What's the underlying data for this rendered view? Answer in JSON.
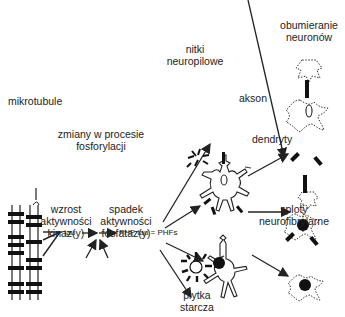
{
  "labels": {
    "mikrotubule": "mikrotubule",
    "zmiany_1": "zmiany w procesie",
    "zmiany_2": "fosforylacji",
    "tau": "tau",
    "phf": "PHF tau = PHFs",
    "wzrost_1": "wzrost",
    "wzrost_2": "aktywności",
    "wzrost_3": "kinaz(y)",
    "spadek_1": "spadek",
    "spadek_2": "aktywności",
    "spadek_3": "fosfataz(y)",
    "nitki_1": "nitki",
    "nitki_2": "neuropilowe",
    "obum_1": "obumieranie",
    "obum_2": "neuronów",
    "akson": "akson",
    "dendryty": "dendryty",
    "sploty_1": "sploty",
    "sploty_2": "neurofibrylarne",
    "plytka_1": "płytka",
    "plytka_2": "starcza"
  },
  "colors": {
    "ink": "#222222",
    "background": "#ffffff"
  }
}
